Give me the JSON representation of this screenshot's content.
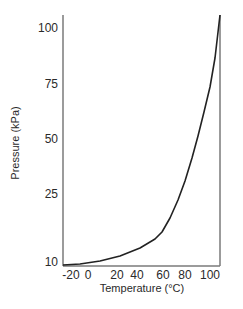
{
  "chart_data": {
    "type": "line",
    "title": "",
    "xlabel": "Temperature (°C)",
    "ylabel": "Pressure (kPa)",
    "xlim": [
      -20,
      100
    ],
    "ylim": [
      10,
      100
    ],
    "grid": false,
    "legend": null,
    "x_ticks": [
      {
        "label": "-20",
        "px": 71
      },
      {
        "label": "0",
        "px": 88
      },
      {
        "label": "20",
        "px": 117
      },
      {
        "label": "40",
        "px": 137
      },
      {
        "label": "60",
        "px": 163
      },
      {
        "label": "80",
        "px": 185
      },
      {
        "label": "100",
        "px": 210
      }
    ],
    "y_ticks": [
      {
        "label": "100",
        "py": 28
      },
      {
        "label": "75",
        "py": 84
      },
      {
        "label": "50",
        "py": 139
      },
      {
        "label": "25",
        "py": 194
      },
      {
        "label": "10",
        "py": 262
      }
    ],
    "series": [
      {
        "name": "Vapor pressure",
        "color": "#222222",
        "x": [
          -20,
          0,
          20,
          40,
          50,
          60,
          70,
          80,
          90,
          100
        ],
        "y": [
          10.5,
          11.5,
          14,
          18,
          21,
          26,
          37,
          50,
          68,
          100
        ]
      }
    ],
    "curve_px": [
      [
        63,
        265
      ],
      [
        80,
        264
      ],
      [
        100,
        261
      ],
      [
        120,
        256
      ],
      [
        140,
        248
      ],
      [
        155,
        239
      ],
      [
        162,
        232
      ],
      [
        170,
        218
      ],
      [
        178,
        200
      ],
      [
        185,
        181
      ],
      [
        192,
        158
      ],
      [
        198,
        136
      ],
      [
        204,
        112
      ],
      [
        210,
        87
      ],
      [
        215,
        58
      ],
      [
        220,
        15
      ]
    ],
    "plot_box_px": {
      "left": 63,
      "top": 15,
      "right": 220,
      "bottom": 266
    },
    "colors": {
      "axis": "#7a7a7a",
      "curve": "#222222",
      "text": "#2a2a2a"
    }
  }
}
